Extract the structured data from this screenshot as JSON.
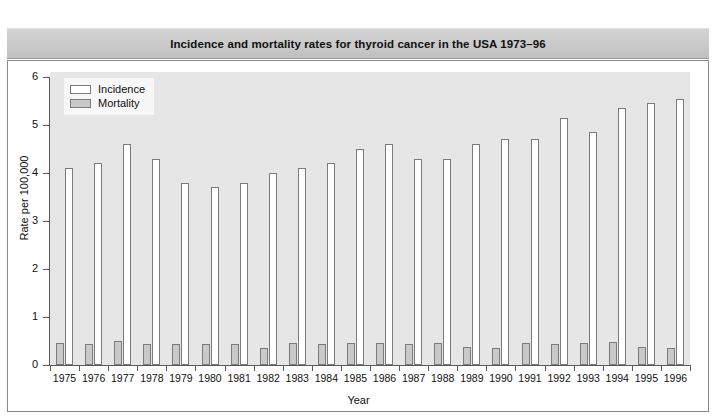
{
  "figure": {
    "title": "Incidence and mortality rates for thyroid cancer in the USA 1973–96"
  },
  "legend": {
    "position": "top-left-inside",
    "entries": [
      {
        "label": "Incidence",
        "swatch": "white-rectangle-icon",
        "color": "#ffffff"
      },
      {
        "label": "Mortality",
        "swatch": "gray-rectangle-icon",
        "color": "#c9c9c9"
      }
    ]
  },
  "colors": {
    "incidence_fill": "#ffffff",
    "mortality_fill": "#c9c9c9",
    "bar_border": "#7b7b7b",
    "plot_background": "#e6e6e6",
    "title_bar": "#cacaca",
    "axis": "#5a5a5a",
    "text": "#111111"
  },
  "chart_data": {
    "type": "bar",
    "title": "Incidence and mortality rates for thyroid cancer in the USA 1973–96",
    "xlabel": "Year",
    "ylabel": "Rate per 100,000",
    "ylim": [
      0,
      6
    ],
    "yticks": [
      0,
      1,
      2,
      3,
      4,
      5,
      6
    ],
    "ytick_labels": [
      "0",
      "1",
      "2",
      "3",
      "4",
      "5",
      "6"
    ],
    "grid": false,
    "legend_position": "upper left",
    "categories": [
      "1975",
      "1976",
      "1977",
      "1978",
      "1979",
      "1980",
      "1981",
      "1982",
      "1983",
      "1984",
      "1985",
      "1986",
      "1987",
      "1988",
      "1989",
      "1990",
      "1991",
      "1992",
      "1993",
      "1994",
      "1995",
      "1996"
    ],
    "series": [
      {
        "name": "Incidence",
        "color": "#ffffff",
        "values": [
          4.1,
          4.2,
          4.6,
          4.3,
          3.8,
          3.7,
          3.8,
          4.0,
          4.1,
          4.2,
          4.5,
          4.6,
          4.3,
          4.3,
          4.6,
          4.7,
          4.7,
          5.15,
          4.85,
          5.35,
          5.45,
          5.55
        ]
      },
      {
        "name": "Mortality",
        "color": "#c9c9c9",
        "values": [
          0.45,
          0.44,
          0.5,
          0.44,
          0.43,
          0.44,
          0.44,
          0.35,
          0.45,
          0.44,
          0.46,
          0.45,
          0.44,
          0.45,
          0.38,
          0.36,
          0.45,
          0.44,
          0.46,
          0.47,
          0.37,
          0.35
        ]
      }
    ]
  }
}
